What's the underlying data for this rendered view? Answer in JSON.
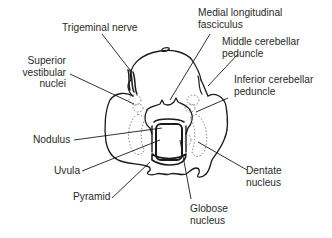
{
  "diagram": {
    "stroke_color": "#1a1a1a",
    "text_color": "#2a2a2a",
    "background": "#ffffff"
  },
  "labels": {
    "trigeminal_nerve": "Trigeminal nerve",
    "superior_vestibular_nuclei": "Superior\nvestibular\nnuclei",
    "medial_longitudinal_fasciculus": "Medial longitudinal\nfasciculus",
    "middle_cerebellar_peduncle": "Middle cerebellar\npeduncle",
    "inferior_cerebellar_peduncle": "Inferior cerebellar\npeduncle",
    "nodulus": "Nodulus",
    "uvula": "Uvula",
    "pyramid": "Pyramid",
    "dentate_nucleus": "Dentate\nnucleus",
    "globose_nucleus": "Globose\nnucleus"
  }
}
